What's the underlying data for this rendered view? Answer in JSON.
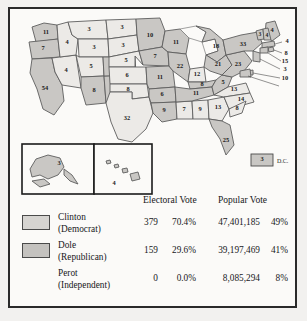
{
  "map": {
    "dc": {
      "value": "3",
      "label": "D.C."
    },
    "insets": {
      "alaska": {
        "value": "3"
      },
      "hawaii": {
        "value": "4"
      }
    },
    "states": [
      {
        "code": "WA",
        "value": "11",
        "party": "dem"
      },
      {
        "code": "OR",
        "value": "7",
        "party": "dem"
      },
      {
        "code": "CA",
        "value": "54",
        "party": "dem"
      },
      {
        "code": "NV",
        "value": "4",
        "party": "rep"
      },
      {
        "code": "ID",
        "value": "4",
        "party": "rep"
      },
      {
        "code": "MT",
        "value": "3",
        "party": "rep"
      },
      {
        "code": "WY",
        "value": "3",
        "party": "rep"
      },
      {
        "code": "UT",
        "value": "5",
        "party": "rep"
      },
      {
        "code": "AZ",
        "value": "8",
        "party": "dem"
      },
      {
        "code": "NM",
        "value": "5",
        "party": "dem"
      },
      {
        "code": "CO",
        "value": "8",
        "party": "dem"
      },
      {
        "code": "ND",
        "value": "3",
        "party": "rep"
      },
      {
        "code": "SD",
        "value": "3",
        "party": "rep"
      },
      {
        "code": "NE",
        "value": "5",
        "party": "rep"
      },
      {
        "code": "KS",
        "value": "6",
        "party": "rep"
      },
      {
        "code": "OK",
        "value": "8",
        "party": "rep"
      },
      {
        "code": "TX",
        "value": "32",
        "party": "rep"
      },
      {
        "code": "MN",
        "value": "10",
        "party": "dem"
      },
      {
        "code": "IA",
        "value": "7",
        "party": "dem"
      },
      {
        "code": "MO",
        "value": "11",
        "party": "dem"
      },
      {
        "code": "AR",
        "value": "6",
        "party": "dem"
      },
      {
        "code": "LA",
        "value": "9",
        "party": "dem"
      },
      {
        "code": "WI",
        "value": "11",
        "party": "dem"
      },
      {
        "code": "IL",
        "value": "22",
        "party": "dem"
      },
      {
        "code": "MS",
        "value": "7",
        "party": "rep"
      },
      {
        "code": "AL",
        "value": "9",
        "party": "rep"
      },
      {
        "code": "MI",
        "value": "18",
        "party": "dem"
      },
      {
        "code": "IN",
        "value": "12",
        "party": "rep"
      },
      {
        "code": "KY",
        "value": "8",
        "party": "dem"
      },
      {
        "code": "TN",
        "value": "11",
        "party": "dem"
      },
      {
        "code": "GA",
        "value": "13",
        "party": "rep"
      },
      {
        "code": "FL",
        "value": "25",
        "party": "dem"
      },
      {
        "code": "OH",
        "value": "21",
        "party": "dem"
      },
      {
        "code": "WV",
        "value": "5",
        "party": "dem"
      },
      {
        "code": "VA",
        "value": "13",
        "party": "rep"
      },
      {
        "code": "NC",
        "value": "14",
        "party": "rep"
      },
      {
        "code": "SC",
        "value": "8",
        "party": "rep"
      },
      {
        "code": "PA",
        "value": "23",
        "party": "dem"
      },
      {
        "code": "NY",
        "value": "33",
        "party": "dem"
      },
      {
        "code": "ME",
        "value": "4",
        "party": "dem"
      },
      {
        "code": "VT",
        "value": "3",
        "party": "dem"
      },
      {
        "code": "NH",
        "value": "4",
        "party": "dem"
      },
      {
        "code": "MA",
        "value": "12",
        "party": "dem"
      },
      {
        "code": "RI",
        "value": "4",
        "party": "dem"
      },
      {
        "code": "CT",
        "value": "8",
        "party": "dem"
      },
      {
        "code": "NJ",
        "value": "15",
        "party": "dem"
      },
      {
        "code": "DE",
        "value": "3",
        "party": "dem"
      },
      {
        "code": "MD",
        "value": "10",
        "party": "dem"
      }
    ]
  },
  "table": {
    "headers": {
      "electoral": "Electoral Vote",
      "popular": "Popular Vote"
    },
    "rows": [
      {
        "candidate": "Clinton",
        "party": "(Democrat)",
        "electoral_votes": "379",
        "electoral_pct": "70.4%",
        "popular_votes": "47,401,185",
        "popular_pct": "49%",
        "swatch": "dem"
      },
      {
        "candidate": "Dole",
        "party": "(Republican)",
        "electoral_votes": "159",
        "electoral_pct": "29.6%",
        "popular_votes": "39,197,469",
        "popular_pct": "41%",
        "swatch": "rep"
      },
      {
        "candidate": "Perot",
        "party": "(Independent)",
        "electoral_votes": "0",
        "electoral_pct": "0.0%",
        "popular_votes": "8,085,294",
        "popular_pct": "8%",
        "swatch": "none"
      }
    ]
  },
  "colors": {
    "democrat_fill": "#c9c7c4",
    "republican_fill": "#eceae7",
    "border": "#2a2a2a",
    "background": "#fbfaf8"
  }
}
